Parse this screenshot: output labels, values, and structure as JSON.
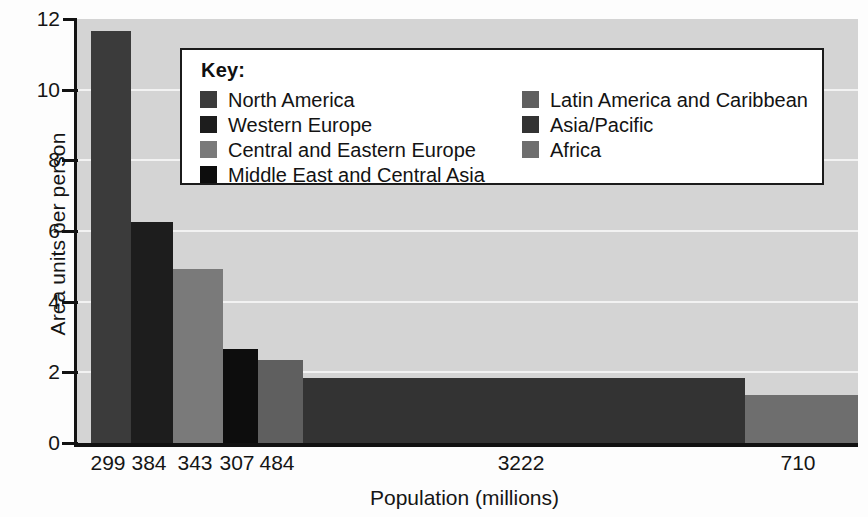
{
  "chart_data": {
    "type": "bar",
    "title": "",
    "xlabel": "Population (millions)",
    "ylabel": "Area units per person",
    "ylim": [
      0,
      12
    ],
    "yticks": [
      0,
      2,
      4,
      6,
      8,
      10,
      12
    ],
    "grid": true,
    "legend_position": "upper-center",
    "orientation": "variable-width-bars",
    "categories": [
      "North America",
      "Western Europe",
      "Central and Eastern Europe",
      "Middle East and Central Asia",
      "Latin America and Caribbean",
      "Asia/Pacific",
      "Africa"
    ],
    "x_tick_labels": [
      "299",
      "384",
      "343",
      "307",
      "484",
      "3222",
      "710"
    ],
    "widths": [
      299,
      384,
      343,
      307,
      484,
      3222,
      710
    ],
    "values": [
      11.66,
      6.25,
      4.92,
      2.65,
      2.35,
      1.83,
      1.36
    ],
    "colors": [
      "#3b3b3b",
      "#1d1d1d",
      "#7a7a7a",
      "#0d0d0d",
      "#5f5f5f",
      "#333333",
      "#6e6e6e"
    ],
    "bars": [
      {
        "label": "North America",
        "population": "299",
        "value": 11.66,
        "left_px": 88,
        "width_px": 40,
        "color": "#3b3b3b"
      },
      {
        "label": "Western Europe",
        "population": "384",
        "value": 6.25,
        "left_px": 128,
        "width_px": 42,
        "color": "#1d1d1d"
      },
      {
        "label": "Central and Eastern Europe",
        "population": "343",
        "value": 4.92,
        "left_px": 170,
        "width_px": 50,
        "color": "#7a7a7a"
      },
      {
        "label": "Middle East and Central Asia",
        "population": "307",
        "value": 2.65,
        "left_px": 220,
        "width_px": 35,
        "color": "#0d0d0d"
      },
      {
        "label": "Latin America and Caribbean",
        "population": "484",
        "value": 2.35,
        "left_px": 255,
        "width_px": 45,
        "color": "#5f5f5f"
      },
      {
        "label": "Asia/Pacific",
        "population": "3222",
        "value": 1.83,
        "left_px": 300,
        "width_px": 442,
        "color": "#333333"
      },
      {
        "label": "Africa",
        "population": "710",
        "value": 1.36,
        "left_px": 742,
        "width_px": 113,
        "color": "#6e6e6e"
      }
    ],
    "x_tick_centers_px": [
      108,
      149,
      195,
      237,
      277,
      521,
      798
    ],
    "plot_background": "#d4d4d4",
    "gridline_color": "#f2f2f2",
    "axis_color": "#121212"
  },
  "legend": {
    "title": "Key:",
    "left_column": [
      {
        "label": "North America",
        "color": "#3b3b3b"
      },
      {
        "label": "Western Europe",
        "color": "#1d1d1d"
      },
      {
        "label": "Central and Eastern Europe",
        "color": "#7a7a7a"
      },
      {
        "label": "Middle East and Central Asia",
        "color": "#0d0d0d"
      }
    ],
    "right_column": [
      {
        "label": "Latin America and Caribbean",
        "color": "#5f5f5f"
      },
      {
        "label": "Asia/Pacific",
        "color": "#333333"
      },
      {
        "label": "Africa",
        "color": "#6e6e6e"
      }
    ]
  },
  "artifact": {
    "edge_text": ""
  }
}
